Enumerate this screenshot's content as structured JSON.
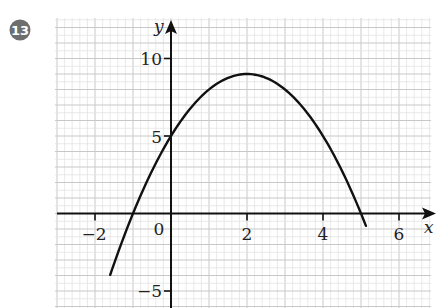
{
  "problem": {
    "number": "13",
    "badge_color": "#6e6e6e",
    "badge_text_color": "#ffffff"
  },
  "chart_data": {
    "type": "line",
    "title": "",
    "xlabel": "x",
    "ylabel": "y",
    "function": "y = -x^2 + 4x + 5",
    "vertex": [
      2,
      9
    ],
    "roots": [
      -1,
      5
    ],
    "y_intercept": 5,
    "xlim": [
      -3.05,
      6.9
    ],
    "ylim": [
      -6.2,
      12.4
    ],
    "x_ticks": [
      -2,
      2,
      4,
      6
    ],
    "x_tick_labels": [
      "−2",
      "2",
      "4",
      "6"
    ],
    "origin_label": "0",
    "y_ticks": [
      10,
      5,
      -5
    ],
    "y_tick_labels": [
      "10",
      "5",
      "−5"
    ],
    "grid": true,
    "legend": "none",
    "series": [
      {
        "name": "parabola",
        "x_range": [
          -1.6,
          5.13
        ],
        "points": [
          [
            -1.6,
            -3.96
          ],
          [
            -1,
            0
          ],
          [
            0,
            5
          ],
          [
            1,
            8
          ],
          [
            2,
            9
          ],
          [
            3,
            8
          ],
          [
            4,
            5
          ],
          [
            5,
            0
          ],
          [
            5.13,
            -0.8
          ]
        ],
        "color": "#111111"
      }
    ],
    "colors": {
      "grid_minor": "#e3e3e3",
      "grid_major": "#c8c8c8",
      "axis": "#111111",
      "curve": "#111111"
    }
  }
}
